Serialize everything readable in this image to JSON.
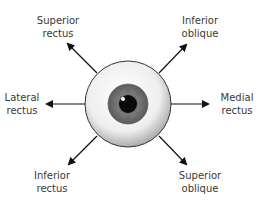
{
  "diagram": {
    "labels": {
      "superior_rectus": [
        "Superior",
        "rectus"
      ],
      "inferior_oblique": [
        "Inferior",
        "oblique"
      ],
      "lateral_rectus": [
        "Lateral",
        "rectus"
      ],
      "medial_rectus": [
        "Medial",
        "rectus"
      ],
      "inferior_rectus": [
        "Inferior",
        "rectus"
      ],
      "superior_oblique": [
        "Superior",
        "oblique"
      ]
    },
    "colors": {
      "arrow": "#111111",
      "text": "#3a3a3a",
      "sclera": "#f2f2f2",
      "iris": "#6e6e6e",
      "pupil": "#0a0a0a"
    }
  }
}
